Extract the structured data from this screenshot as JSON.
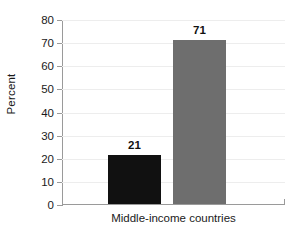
{
  "chart_data": {
    "type": "bar",
    "title": "",
    "xlabel": "",
    "ylabel": "Percent",
    "categories": [
      "Middle-income countries"
    ],
    "series": [
      {
        "name": "Series 1",
        "values": [
          21
        ],
        "color": "#111111"
      },
      {
        "name": "Series 2",
        "values": [
          71
        ],
        "color": "#6e6e6e"
      }
    ],
    "bars": [
      {
        "label": "21",
        "value": 21,
        "color": "#111111"
      },
      {
        "label": "71",
        "value": 71,
        "color": "#6e6e6e"
      }
    ],
    "ylim": [
      0,
      80
    ],
    "ytick_values": [
      0,
      10,
      20,
      30,
      40,
      50,
      60,
      70,
      80
    ],
    "ytick_labels": [
      "0",
      "10",
      "20",
      "30",
      "40",
      "50",
      "60",
      "70",
      "80"
    ],
    "grid": true,
    "legend": "none",
    "axis_color": "#9a9a9a",
    "grid_color": "#ededed",
    "background": "#ffffff"
  }
}
